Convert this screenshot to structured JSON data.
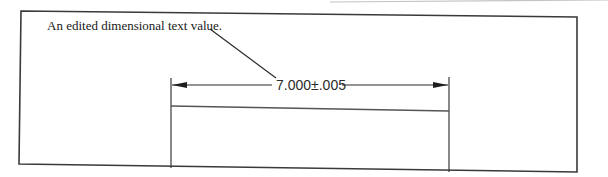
{
  "figure": {
    "caption": "An edited dimensional text value.",
    "dimension": {
      "value_text": "7.000±.005",
      "nominal": "7.000",
      "tolerance": "±.005"
    },
    "colors": {
      "background": "#ffffff",
      "frame": "#333333",
      "line": "#2b2b2b",
      "text": "#1a1a1a",
      "faint_edge": "#bbbbbb"
    }
  }
}
